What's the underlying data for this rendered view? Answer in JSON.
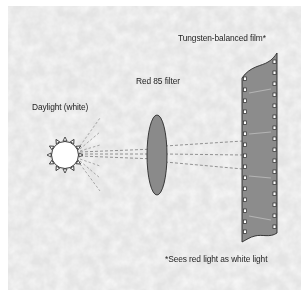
{
  "diagram": {
    "labels": {
      "light_source": "Daylight (white)",
      "filter": "Red 85 filter",
      "film": "Tungsten-balanced film*",
      "footnote": "*Sees red light as white light"
    },
    "elements": [
      {
        "id": "sun",
        "type": "light-source",
        "label": "Daylight (white)"
      },
      {
        "id": "filter",
        "type": "lens-filter",
        "label": "Red 85 filter"
      },
      {
        "id": "film",
        "type": "film-strip",
        "label": "Tungsten-balanced film*"
      }
    ],
    "colors": {
      "background": "#eeeeee",
      "border": "#ffffff",
      "filter_fill": "#8a8a8a",
      "film_fill": "#8c8c8c",
      "outline": "#2a2a2a",
      "dash": "#6a6a6a"
    }
  }
}
